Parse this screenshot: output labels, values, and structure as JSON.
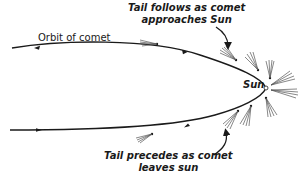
{
  "diagram": {
    "labels": {
      "orbit": "Orbit of comet",
      "approach_line1": "Tail follows as comet",
      "approach_line2": "approaches Sun",
      "leaves_line1": "Tail precedes as comet",
      "leaves_line2": "leaves sun",
      "sun": "Sun"
    },
    "elements": {
      "orbit_path": "parabolic-orbit",
      "sun_marker": "small-circle",
      "direction_arrows": 4,
      "comet_tails": 8,
      "pointer_arrows": 2
    },
    "colors": {
      "line": "#1a1a1a",
      "tail": "#555555",
      "background": "#ffffff"
    }
  }
}
